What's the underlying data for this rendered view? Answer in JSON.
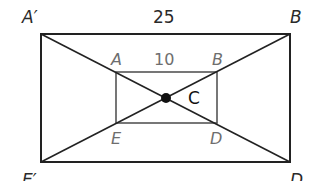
{
  "diagram": {
    "outer_rectangle": {
      "vertices": {
        "top_left": "A′",
        "top_right": "B",
        "bottom_right": "D",
        "bottom_left": "E′"
      },
      "top_side_length": "25",
      "x1": 41,
      "y1": 34,
      "x2": 290,
      "y2": 162
    },
    "inner_rectangle": {
      "vertices": {
        "top_left": "A",
        "top_right": "B",
        "bottom_right": "D",
        "bottom_left": "E"
      },
      "top_side_length": "10",
      "x1": 116,
      "y1": 72,
      "x2": 217,
      "y2": 123
    },
    "center": {
      "label": "C",
      "x": 166,
      "y": 98
    },
    "colors": {
      "outer_stroke": "#222222",
      "inner_stroke": "#555555",
      "inner_labels": "#6e6e6e"
    }
  }
}
